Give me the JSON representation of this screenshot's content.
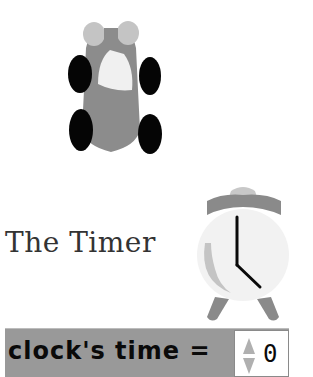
{
  "stage": {
    "sprites": [
      {
        "name": "car",
        "icon": "car-top-view-icon"
      },
      {
        "name": "alarm-clock",
        "icon": "alarm-clock-icon"
      }
    ],
    "title": "The Timer",
    "colors": {
      "background": "#ffffff",
      "car_body": "#8c8c8c",
      "car_wheels": "#050505",
      "car_windshield": "#f0f0f0",
      "car_headlights": "#c4c4c4",
      "clock_face": "#f2f2f2",
      "clock_frame": "#8a8a8a",
      "clock_hands": "#0a0a0a",
      "watcher_bg": "#999999"
    }
  },
  "watcher": {
    "label": "clock's time =",
    "value": "0",
    "spinner_icon": "up-down-arrows-icon"
  }
}
